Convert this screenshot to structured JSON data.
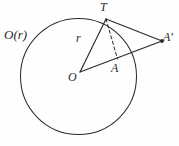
{
  "figure": {
    "background_color": "#fefefe",
    "stroke_color": "#2b2b2b",
    "labels": {
      "circle_name": "O(r)",
      "point_t": "T",
      "point_a_prime": "A'",
      "point_a": "A",
      "point_o": "O",
      "radius": "r"
    },
    "geometry": {
      "circle": {
        "cx": 78.5,
        "cy": 76.5,
        "r": 58
      },
      "points": {
        "O": {
          "x": 80,
          "y": 72
        },
        "T": {
          "x": 106,
          "y": 19
        },
        "A": {
          "x": 117.5,
          "y": 59
        },
        "A_prime": {
          "x": 162,
          "y": 41
        }
      },
      "segments": [
        {
          "name": "OT",
          "from": "O",
          "to": "T",
          "style": "solid"
        },
        {
          "name": "OA-prime",
          "from": "O",
          "to": "A_prime",
          "style": "solid"
        },
        {
          "name": "T-A-prime",
          "from": "T",
          "to": "A_prime",
          "style": "solid"
        },
        {
          "name": "TA",
          "from": "T",
          "to": "A",
          "style": "dashed"
        }
      ],
      "markers": [
        {
          "name": "A-prime-dot",
          "x": 162,
          "y": 41,
          "r": 1.9
        }
      ]
    }
  }
}
